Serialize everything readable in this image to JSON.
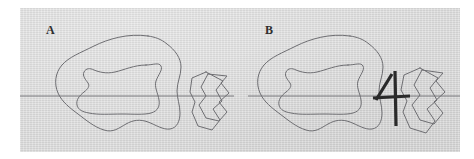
{
  "figure": {
    "kind": "two-panel line-drawing figure",
    "background_color": "#ffffff",
    "plate_color": "#dcdcdc",
    "contour_color": "#6e6e72",
    "axis_color": "#7a7a7e",
    "mark_color": "#2a2a2a"
  },
  "panels": [
    {
      "id": "a",
      "label": "A",
      "has_mark": false,
      "shapes": [
        "outer-blob",
        "inner-blob",
        "angular-polygon-outer",
        "angular-polygon-inner"
      ],
      "axis": {
        "y": 88,
        "x1": -20,
        "x2": 214
      }
    },
    {
      "id": "b",
      "label": "B",
      "has_mark": true,
      "mark_name": "four-shaped-tick-mark",
      "shapes": [
        "outer-blob",
        "inner-blob",
        "angular-polygon-outer",
        "angular-polygon-inner"
      ],
      "axis": {
        "y": 88,
        "x1": 8,
        "x2": 240
      }
    }
  ]
}
